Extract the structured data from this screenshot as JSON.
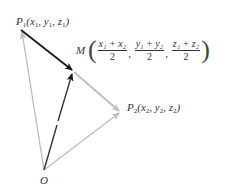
{
  "diagram": {
    "colors": {
      "dark_vector": "#1a1a1a",
      "light_vector": "#bdbdbd",
      "label": "#333333"
    },
    "points": {
      "P1": {
        "label": "P",
        "sub": "1",
        "coords": [
          "x",
          "1",
          "y",
          "1",
          "z",
          "1"
        ],
        "x": 21,
        "y": 30
      },
      "P2": {
        "label": "P",
        "sub": "2",
        "coords": [
          "x",
          "2",
          "y",
          "2",
          "z",
          "2"
        ],
        "x": 121,
        "y": 112
      },
      "M": {
        "label": "M",
        "x": 73,
        "y": 71
      },
      "O": {
        "label": "O",
        "x": 44,
        "y": 171
      }
    },
    "labels": {
      "p1_text": "P₁(x₁, y₁, z₁)",
      "p2_text": "P₂(x₂, y₂, z₂)",
      "m_name": "M",
      "m_frac1_num": "x₁ + x₂",
      "m_frac2_num": "y₁ + y₂",
      "m_frac3_num": "z₁ + z₂",
      "m_den": "2",
      "o_name": "O"
    },
    "edges": [
      {
        "from": "O",
        "to": "P1",
        "style": "light",
        "arrow": true
      },
      {
        "from": "O",
        "to": "P2",
        "style": "light",
        "arrow": true
      },
      {
        "from": "O",
        "to": "M",
        "style": "dark",
        "arrow": true
      },
      {
        "from": "P1",
        "to": "M",
        "style": "dark",
        "arrow": true
      },
      {
        "from": "M",
        "to": "P2",
        "style": "light",
        "arrow": true
      }
    ]
  }
}
